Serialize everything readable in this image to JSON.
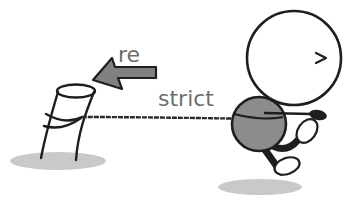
{
  "illustration": {
    "labels": {
      "arrow_text": "re",
      "rope_text": "strict"
    },
    "eye_glyph": ">",
    "colors": {
      "outline": "#1e1e1e",
      "body_fill": "#8c8c8c",
      "arrow_fill": "#808080",
      "shadow": "#c9c9c9",
      "text": "#6e6e6e",
      "background": "#ffffff"
    }
  }
}
